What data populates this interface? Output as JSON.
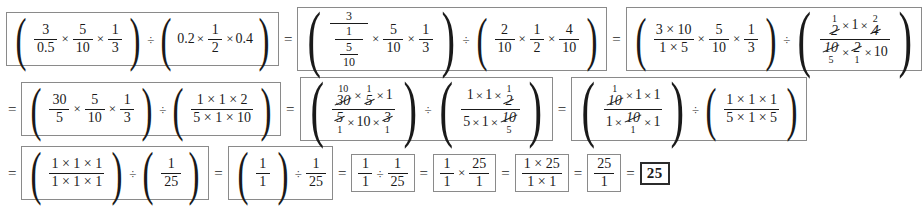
{
  "document": {
    "type": "math-worksheet-solution",
    "title": "Fraction division step-by-step solution",
    "final_answer": "25"
  },
  "symbols": {
    "equals": "=",
    "times": "×",
    "divide": "÷",
    "paren_left": "(",
    "paren_right": ")"
  },
  "row1": {
    "step1": {
      "group_a": {
        "f1": {
          "num": "3",
          "den": "0.5"
        },
        "f2": {
          "num": "5",
          "den": "10"
        },
        "f3": {
          "num": "1",
          "den": "3"
        }
      },
      "group_b": {
        "t1": "0.2",
        "f2": {
          "num": "1",
          "den": "2"
        },
        "t3": "0.4"
      }
    },
    "step2": {
      "group_a": {
        "complex": {
          "num": "3",
          "den_num": "1",
          "den_den_top": "5",
          "den_den_bot": "10"
        },
        "f2": {
          "num": "5",
          "den": "10"
        },
        "f3": {
          "num": "1",
          "den": "3"
        }
      },
      "group_b": {
        "f1": {
          "num": "2",
          "den": "10"
        },
        "f2": {
          "num": "1",
          "den": "2"
        },
        "f3": {
          "num": "4",
          "den": "10"
        }
      }
    },
    "step3": {
      "group_a": {
        "f1": {
          "num": "3 × 10",
          "den": "1 × 5"
        },
        "f2": {
          "num": "5",
          "den": "10"
        },
        "f3": {
          "num": "1",
          "den": "3"
        }
      },
      "group_b": {
        "numerator": {
          "a": {
            "value": "2",
            "replacement": "1",
            "position": "above"
          },
          "b": "1",
          "c": {
            "value": "4",
            "replacement": "2",
            "position": "above"
          }
        },
        "denominator": {
          "a": {
            "value": "10",
            "replacement": "5",
            "position": "below"
          },
          "b": {
            "value": "2",
            "replacement": "1",
            "position": "below"
          },
          "c": "10"
        }
      }
    }
  },
  "row2": {
    "step4": {
      "group_a": {
        "f1": {
          "num": "30",
          "den": "5"
        },
        "f2": {
          "num": "5",
          "den": "10"
        },
        "f3": {
          "num": "1",
          "den": "3"
        }
      },
      "group_b": {
        "f1": {
          "num": "1 × 1 × 2",
          "den": "5 × 1 × 10"
        }
      }
    },
    "step5": {
      "group_a": {
        "numerator": {
          "a": {
            "value": "30",
            "replacement": "10",
            "position": "above"
          },
          "b": {
            "value": "5",
            "replacement": "1",
            "position": "above"
          },
          "c": "1"
        },
        "denominator": {
          "a": {
            "value": "5",
            "replacement": "1",
            "position": "below"
          },
          "b": "10",
          "c": {
            "value": "3",
            "replacement": "1",
            "position": "below"
          }
        }
      },
      "group_b": {
        "numerator": {
          "a": "1",
          "b": "1",
          "c": {
            "value": "2",
            "replacement": "1",
            "position": "above"
          }
        },
        "denominator": {
          "a": "5",
          "b": "1",
          "c": {
            "value": "10",
            "replacement": "5",
            "position": "below"
          }
        }
      }
    },
    "step6": {
      "group_a": {
        "numerator": {
          "a": {
            "value": "10",
            "replacement": "1",
            "position": "above"
          },
          "b": "1",
          "c": "1"
        },
        "denominator": {
          "a": "1",
          "b": {
            "value": "10",
            "replacement": "1",
            "position": "below"
          },
          "c": "1"
        }
      },
      "group_b": {
        "f1": {
          "num": "1 × 1 × 1",
          "den": "5 × 1 × 5"
        }
      }
    }
  },
  "row3": {
    "step7": {
      "group_a": {
        "num": "1 × 1 × 1",
        "den": "1 × 1 × 1"
      },
      "group_b": {
        "num": "1",
        "den": "25"
      }
    },
    "step8": {
      "group_a": {
        "num": "1",
        "den": "1"
      },
      "group_b": {
        "num": "1",
        "den": "25"
      }
    },
    "step9": {
      "f1": {
        "num": "1",
        "den": "1"
      },
      "f2": {
        "num": "1",
        "den": "25"
      }
    },
    "step10": {
      "f1": {
        "num": "1",
        "den": "1"
      },
      "f2": {
        "num": "25",
        "den": "1"
      }
    },
    "step11": {
      "num": "1 × 25",
      "den": "1 × 1"
    },
    "step12": {
      "num": "25",
      "den": "1"
    },
    "answer": "25"
  }
}
